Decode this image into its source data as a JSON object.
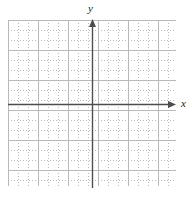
{
  "figure": {
    "kind": "blank-cartesian-grid",
    "background_color": "#ffffff"
  },
  "grid": {
    "name": "dotted-graph-grid",
    "line_color": "#b9b9b9",
    "line_style": "dotted",
    "cell_size_px": 10,
    "left_px": 8,
    "top_px": 20,
    "width_px": 168,
    "height_px": 166,
    "columns": 17,
    "rows": 17,
    "labels_shown": false,
    "tick_numbers": []
  },
  "axes": {
    "color": "#4d4d4d",
    "origin": {
      "x_px": 92,
      "y_px": 104
    },
    "x_axis": {
      "label": "x",
      "start_px": 8,
      "end_px": 176,
      "arrow": "right",
      "arrow_tip_px": 176
    },
    "y_axis": {
      "label": "y",
      "start_px": 188,
      "end_px": 19,
      "arrow": "up",
      "arrow_tip_px": 19
    }
  },
  "chart_data": {
    "type": "scatter",
    "title": "",
    "xlabel": "x",
    "ylabel": "y",
    "series": [],
    "x": [],
    "values": [],
    "xlim": [
      -8.4,
      8.4
    ],
    "ylim": [
      -8.2,
      8.4
    ],
    "grid": true,
    "legend": "none",
    "annotations": []
  }
}
